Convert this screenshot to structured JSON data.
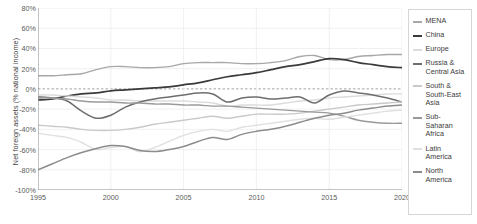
{
  "chart_data": {
    "type": "line",
    "title": "",
    "xlabel": "",
    "ylabel": "Net foreign assets (% national income)",
    "xlim": [
      1995,
      2020
    ],
    "ylim": [
      -100,
      80
    ],
    "grid": true,
    "zero_line": true,
    "legend_position": "right",
    "ytick_labels": [
      "80%",
      "60%",
      "40%",
      "20%",
      "0%",
      "-20%",
      "-40%",
      "-60%",
      "-80%",
      "-100%"
    ],
    "ytick_values": [
      80,
      60,
      40,
      20,
      0,
      -20,
      -40,
      -60,
      -80,
      -100
    ],
    "xtick_labels": [
      "1995",
      "2000",
      "2005",
      "2010",
      "2015",
      "2020"
    ],
    "xtick_values": [
      1995,
      2000,
      2005,
      2010,
      2015,
      2020
    ],
    "x": [
      1995,
      1996,
      1997,
      1998,
      1999,
      2000,
      2001,
      2002,
      2003,
      2004,
      2005,
      2006,
      2007,
      2008,
      2009,
      2010,
      2011,
      2012,
      2013,
      2014,
      2015,
      2016,
      2017,
      2018,
      2019,
      2020
    ],
    "series": [
      {
        "name": "MENA",
        "color": "#a8a8a8",
        "width": 1.4,
        "values": [
          13,
          13,
          14,
          15,
          19,
          22,
          22,
          21,
          21,
          22,
          25,
          26,
          26,
          26,
          25,
          25,
          26,
          28,
          32,
          33,
          29,
          29,
          32,
          33,
          34,
          34
        ]
      },
      {
        "name": "China",
        "color": "#3a3a3a",
        "width": 1.7,
        "values": [
          -11,
          -10,
          -7,
          -5,
          -4,
          -2,
          -1,
          0,
          1,
          2,
          4,
          6,
          9,
          12,
          14,
          16,
          19,
          22,
          24,
          27,
          30,
          29,
          26,
          24,
          22,
          21
        ]
      },
      {
        "name": "Europe",
        "color": "#dcdcdc",
        "width": 1.4,
        "values": [
          -6,
          -6,
          -7,
          -8,
          -9,
          -11,
          -11,
          -12,
          -12,
          -12,
          -12,
          -13,
          -14,
          -17,
          -16,
          -16,
          -16,
          -14,
          -12,
          -11,
          -9,
          -8,
          -7,
          -6,
          -5,
          -5
        ]
      },
      {
        "name": "Russia & Central Asia",
        "color": "#6e6e6e",
        "width": 1.5,
        "values": [
          -8,
          -9,
          -12,
          -22,
          -29,
          -26,
          -18,
          -13,
          -10,
          -8,
          -6,
          -4,
          -5,
          -13,
          -9,
          -8,
          -10,
          -9,
          -8,
          -14,
          -6,
          -2,
          -4,
          -6,
          -9,
          -13
        ]
      },
      {
        "name": "South & South-East Asia",
        "color": "#c9c9c9",
        "width": 1.4,
        "values": [
          -36,
          -37,
          -38,
          -40,
          -41,
          -41,
          -40,
          -38,
          -35,
          -33,
          -31,
          -29,
          -27,
          -29,
          -27,
          -25,
          -25,
          -25,
          -24,
          -22,
          -20,
          -18,
          -16,
          -15,
          -14,
          -13
        ]
      },
      {
        "name": "Sub-Saharan Africa",
        "color": "#9a9a9a",
        "width": 1.4,
        "values": [
          -9,
          -9,
          -10,
          -12,
          -13,
          -13,
          -14,
          -14,
          -15,
          -15,
          -16,
          -16,
          -17,
          -17,
          -18,
          -19,
          -20,
          -21,
          -22,
          -23,
          -24,
          -27,
          -31,
          -33,
          -34,
          -34
        ]
      },
      {
        "name": "Latin America",
        "color": "#e0e0e0",
        "width": 1.4,
        "values": [
          -44,
          -46,
          -48,
          -53,
          -60,
          -58,
          -57,
          -62,
          -58,
          -52,
          -46,
          -42,
          -40,
          -42,
          -38,
          -36,
          -34,
          -32,
          -30,
          -29,
          -30,
          -28,
          -26,
          -24,
          -22,
          -21
        ]
      },
      {
        "name": "North America",
        "color": "#8c8c8c",
        "width": 1.5,
        "values": [
          -80,
          -74,
          -68,
          -63,
          -59,
          -56,
          -57,
          -61,
          -62,
          -60,
          -57,
          -52,
          -48,
          -50,
          -45,
          -42,
          -40,
          -37,
          -33,
          -29,
          -26,
          -24,
          -21,
          -19,
          -17,
          -16
        ]
      }
    ]
  },
  "legend": {
    "items": [
      {
        "label": "MENA",
        "color": "#a8a8a8"
      },
      {
        "label": "China",
        "color": "#3a3a3a"
      },
      {
        "label": "Europe",
        "color": "#dcdcdc"
      },
      {
        "label": "Russia &\nCentral Asia",
        "color": "#6e6e6e"
      },
      {
        "label": "South &\nSouth-East\nAsia",
        "color": "#c9c9c9"
      },
      {
        "label": "Sub-Saharan\nAfrica",
        "color": "#9a9a9a"
      },
      {
        "label": "Latin\nAmerica",
        "color": "#e0e0e0"
      },
      {
        "label": "North\nAmerica",
        "color": "#8c8c8c"
      }
    ]
  }
}
